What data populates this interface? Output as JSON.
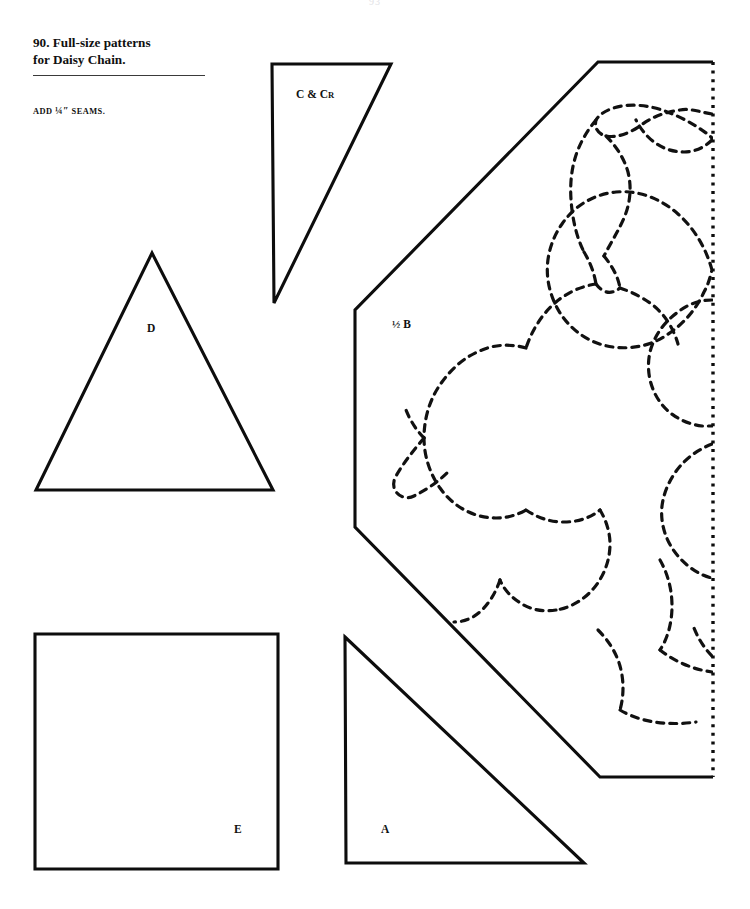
{
  "page": {
    "number": "93",
    "background_color": "#ffffff",
    "ink_color": "#0d0d0d"
  },
  "caption": {
    "line1": "90. Full-size patterns",
    "line2": "for Daisy Chain.",
    "seams_prefix": "ADD ",
    "seams_fraction": "¼″",
    "seams_suffix": " SEAMS."
  },
  "pieces": [
    {
      "id": "C",
      "label_main": "C & C",
      "label_sub": "R",
      "shape": "right-triangle",
      "label_x": 296,
      "label_y": 88
    },
    {
      "id": "D",
      "label_main": "D",
      "shape": "isosceles-triangle",
      "label_x": 147,
      "label_y": 322
    },
    {
      "id": "B",
      "label_half": "½",
      "label_main": "B",
      "shape": "half-hexagon-with-quilting",
      "label_x": 392,
      "label_y": 318
    },
    {
      "id": "E",
      "label_main": "E",
      "shape": "square",
      "label_x": 234,
      "label_y": 823
    },
    {
      "id": "A",
      "label_main": "A",
      "shape": "right-triangle",
      "label_x": 381,
      "label_y": 823
    }
  ],
  "geometry": {
    "rule": {
      "x": 33,
      "y": 75,
      "width": 172
    },
    "triangle_c": "M 272,64 L 391,64 L 274,303 Z",
    "triangle_d": "M 152,253 L 273,490 L 36,490 Z",
    "square_e": "M 35,634 L 278,634 L 278,869 L 35,869 Z",
    "triangle_a": "M 345,637 L 584,863 L 346,863 Z",
    "half_b_solid": "M 713,62 L 598,62 L 355,310 L 355,527 L 600,777 L 713,777",
    "half_b_fold": "M 713,62 L 713,777"
  },
  "quilting_motif": {
    "description": "dashed daisy-chain quilting design: three daisy petals and leaves",
    "paths": [
      "M 712,114 C 700,112 690,108 680,110 C 664,112 650,118 640,126 C 628,134 616,138 606,136 C 598,134 594,128 596,120 C 600,113 610,108 622,106 C 636,104 650,106 662,110 C 674,114 686,120 696,126 C 702,130 708,134 712,138",
      "M 712,140 C 704,148 694,152 684,152 C 672,152 662,148 654,142 C 646,136 640,128 636,120",
      "M 606,136 C 616,146 624,158 628,172 C 632,188 630,204 624,218 C 618,232 610,244 604,256",
      "M 596,120 C 586,132 578,146 574,162 C 570,178 570,194 572,210 C 574,226 578,240 584,252",
      "M 604,256 C 612,266 618,276 620,288",
      "M 584,252 C 590,262 594,272 596,284",
      "M 596,284 C 602,292 610,296 620,288",
      "M 620,288 C 632,292 644,298 654,306 C 666,316 674,330 678,344",
      "M 596,284 C 582,286 568,292 556,302 C 542,314 532,330 526,348",
      "M 712,270 C 706,248 694,228 678,214 C 660,198 638,190 616,192 C 594,194 574,206 562,224 C 548,244 544,268 550,290 C 556,312 570,330 590,340 C 610,350 634,350 654,342 C 676,332 694,314 704,292 C 708,285 710,278 712,270",
      "M 712,300 C 700,300 688,304 678,312 C 664,322 654,336 650,352 C 646,370 650,388 660,402 C 670,416 686,424 702,426 C 706,426 709,426 712,426",
      "M 712,444 C 702,448 692,454 684,462 C 672,474 664,490 662,506 C 660,524 666,542 678,556 C 688,568 702,576 712,578",
      "M 526,348 C 512,344 496,344 482,350 C 466,356 452,368 442,382 C 430,398 424,418 424,438 C 424,456 430,474 440,488 C 450,502 464,512 480,516 C 496,520 512,518 526,510",
      "M 424,438 C 414,450 404,462 396,476 C 388,490 402,502 414,496 C 426,490 438,482 448,472",
      "M 526,510 C 538,518 550,522 564,522 C 578,522 590,518 600,510",
      "M 600,510 C 606,520 610,532 610,544 C 610,560 604,576 594,588 C 584,600 570,608 556,610",
      "M 556,610 C 544,612 532,610 522,604 C 512,598 504,590 500,580",
      "M 500,580 C 496,592 490,602 482,610 C 474,618 464,622 454,622",
      "M 660,560 C 668,574 672,590 672,606 C 672,622 668,638 660,650",
      "M 660,650 C 670,658 682,664 694,668 C 700,670 706,671 712,672",
      "M 598,630 C 608,640 616,652 620,666 C 624,680 624,696 620,710",
      "M 620,710 C 630,716 642,720 654,722 C 668,724 682,724 696,722",
      "M 712,656 C 704,648 698,638 694,628",
      "M 424,438 C 416,430 410,420 406,410"
    ]
  }
}
